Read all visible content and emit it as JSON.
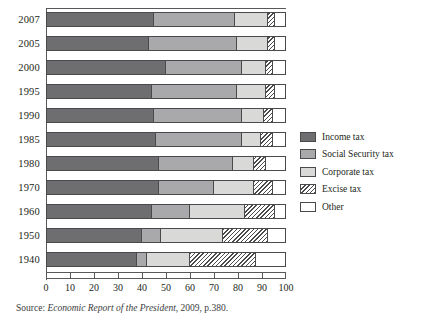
{
  "source_note": {
    "prefix": "Source: ",
    "italic": "Economic Report of the President",
    "suffix": ", 2009, p.380."
  },
  "legend": {
    "position": "right",
    "items": [
      {
        "label": "Income tax",
        "color": "#6e6e70",
        "pattern": "solid",
        "swatch_name": "legend-swatch-income-tax"
      },
      {
        "label": "Social Security tax",
        "color": "#a9a9ab",
        "pattern": "solid",
        "swatch_name": "legend-swatch-social-security-tax"
      },
      {
        "label": "Corporate tax",
        "color": "#d9d9d7",
        "pattern": "solid",
        "swatch_name": "legend-swatch-corporate-tax"
      },
      {
        "label": "Excise tax",
        "color": "#ffffff",
        "pattern": "diagonal-hatch",
        "swatch_name": "legend-swatch-excise-tax"
      },
      {
        "label": "Other",
        "color": "#ffffff",
        "pattern": "solid",
        "swatch_name": "legend-swatch-other"
      }
    ]
  },
  "chart_data": {
    "type": "bar",
    "orientation": "horizontal",
    "stacked": true,
    "normalized_percent": true,
    "title": "",
    "subtitle": "",
    "xlabel": "",
    "ylabel": "",
    "xlim": [
      0,
      100
    ],
    "ylim": null,
    "grid": false,
    "xticks": [
      0,
      10,
      20,
      30,
      40,
      50,
      60,
      70,
      80,
      90,
      100
    ],
    "xticklabels": [
      "0",
      "10",
      "20",
      "30",
      "40",
      "50",
      "60",
      "70",
      "80",
      "90",
      "100"
    ],
    "categories": [
      "2007",
      "2005",
      "2000",
      "1995",
      "1990",
      "1985",
      "1980",
      "1970",
      "1960",
      "1950",
      "1940"
    ],
    "series": [
      {
        "name": "Income tax",
        "values": [
          45,
          43,
          50,
          44,
          45,
          46,
          47,
          47,
          44,
          40,
          38
        ]
      },
      {
        "name": "Social Security tax",
        "values": [
          34,
          37,
          32,
          36,
          37,
          36,
          31,
          23,
          16,
          8,
          4
        ]
      },
      {
        "name": "Corporate tax",
        "values": [
          14,
          13,
          10,
          12,
          9,
          8,
          9,
          17,
          23,
          26,
          18
        ]
      },
      {
        "name": "Excise tax",
        "values": [
          3,
          3,
          3,
          4,
          4,
          5,
          5,
          8,
          13,
          19,
          28
        ]
      },
      {
        "name": "Other",
        "values": [
          4,
          4,
          5,
          4,
          5,
          5,
          8,
          5,
          4,
          7,
          12
        ]
      }
    ]
  }
}
